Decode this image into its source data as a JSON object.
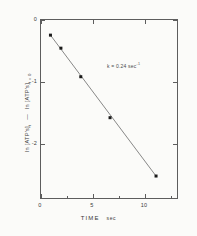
{
  "figure": {
    "background_color": "#fbfbf9",
    "frame_color": "#5d5d5d",
    "line_color": "#6a6a6a",
    "marker_color": "#1a1a1a"
  },
  "chart_data": {
    "type": "scatter",
    "title": "",
    "xlabel": "TIME",
    "xunit": "sec",
    "ylabel_part1": "ln [ATP's]",
    "ylabel_sub1": "t",
    "ylabel_dash": "—",
    "ylabel_part2": "ln [ATP's]",
    "ylabel_sub2": "t = 0",
    "xlim": [
      -1.0,
      12.2
    ],
    "ylim": [
      -2.72,
      0.18
    ],
    "xticks": [
      0,
      5,
      10
    ],
    "xtick_labels": [
      "0",
      "5",
      "10"
    ],
    "yticks": [
      0,
      -1,
      -2
    ],
    "ytick_labels": [
      "0",
      "-1",
      "-2"
    ],
    "grid": false,
    "legend": null,
    "x": [
      0.0,
      1.0,
      2.9,
      5.7,
      10.1
    ],
    "y": [
      -0.08,
      -0.29,
      -0.75,
      -1.41,
      -2.35
    ],
    "fit_line": {
      "x": [
        0.0,
        10.1
      ],
      "y": [
        -0.08,
        -2.35
      ],
      "slope": -0.2248,
      "intercept": -0.08
    },
    "annotations": [
      {
        "text": "k = 0.24 sec",
        "superscript": "-1",
        "x": 6.6,
        "y": -0.7
      }
    ]
  }
}
